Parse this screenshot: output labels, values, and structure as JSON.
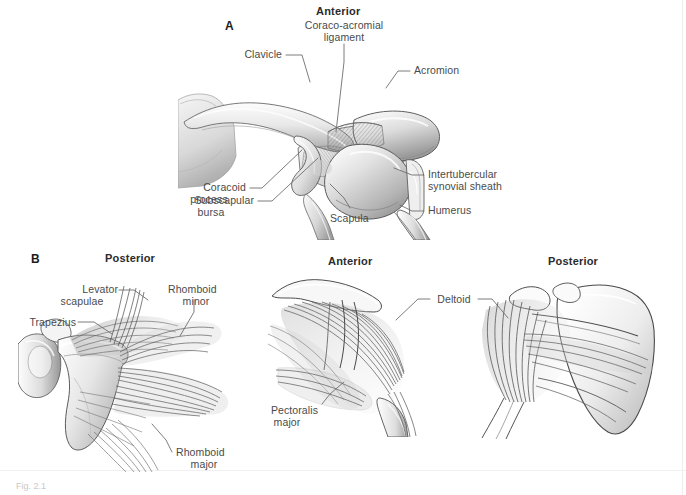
{
  "figure": {
    "caption": "Fig. 2.1",
    "panels": [
      {
        "letter": "A",
        "orientation_heading": "Anterior",
        "labels": [
          {
            "name": "coraco-acromial-ligament",
            "text": "Coraco-acromial\nligament"
          },
          {
            "name": "clavicle",
            "text": "Clavicle"
          },
          {
            "name": "acromion",
            "text": "Acromion"
          },
          {
            "name": "intertubercular-synovial-sheath",
            "text": "Intertubercular\nsynovial sheath"
          },
          {
            "name": "humerus",
            "text": "Humerus"
          },
          {
            "name": "coracoid-process",
            "text": "Coracoid\nprocess"
          },
          {
            "name": "subscapular-bursa",
            "text": "Subscapular\nbursa"
          },
          {
            "name": "scapula",
            "text": "Scapula"
          }
        ]
      },
      {
        "letter": "B",
        "views": [
          {
            "name": "posterior-left",
            "orientation_heading": "Posterior",
            "labels": [
              {
                "name": "levator-scapulae",
                "text": "Levator\nscapulae"
              },
              {
                "name": "rhomboid-minor",
                "text": "Rhomboid\nminor"
              },
              {
                "name": "trapezius",
                "text": "Trapezius"
              },
              {
                "name": "rhomboid-major",
                "text": "Rhomboid\nmajor"
              }
            ]
          },
          {
            "name": "anterior-middle",
            "orientation_heading": "Anterior",
            "labels": [
              {
                "name": "deltoid",
                "text": "Deltoid"
              },
              {
                "name": "pectoralis-major",
                "text": "Pectoralis\nmajor"
              }
            ]
          },
          {
            "name": "posterior-right",
            "orientation_heading": "Posterior",
            "labels": []
          }
        ]
      }
    ]
  },
  "text": {
    "panel_a_letter": "A",
    "panel_b_letter": "B",
    "a_anterior": "Anterior",
    "a_coraco_acromial_1": "Coraco-acromial",
    "a_coraco_acromial_2": "ligament",
    "a_clavicle": "Clavicle",
    "a_acromion": "Acromion",
    "a_intertubercular_1": "Intertubercular",
    "a_intertubercular_2": "synovial sheath",
    "a_humerus": "Humerus",
    "a_coracoid_1": "Coracoid",
    "a_coracoid_2": "process",
    "a_subscapular_1": "Subscapular",
    "a_subscapular_2": "bursa",
    "a_scapula": "Scapula",
    "b_posterior_left": "Posterior",
    "b_anterior_mid": "Anterior",
    "b_posterior_right": "Posterior",
    "b_levator_1": "Levator",
    "b_levator_2": "scapulae",
    "b_rhomboid_minor_1": "Rhomboid",
    "b_rhomboid_minor_2": "minor",
    "b_trapezius": "Trapezius",
    "b_rhomboid_major_1": "Rhomboid",
    "b_rhomboid_major_2": "major",
    "b_deltoid": "Deltoid",
    "b_pectoralis_1": "Pectoralis",
    "b_pectoralis_2": "major",
    "caption": "Fig. 2.1"
  },
  "colors": {
    "background": "#ffffff",
    "label_text": "#4a4a4a",
    "heading_text": "#2b2b2b",
    "leader_line": "#6e6e6e",
    "bone_light": "#f2f2f2",
    "bone_mid": "#cfcfcf",
    "bone_dark": "#8e8e8e",
    "outline": "#4f4f4f",
    "muscle_fiber": "#5a5a5a"
  }
}
